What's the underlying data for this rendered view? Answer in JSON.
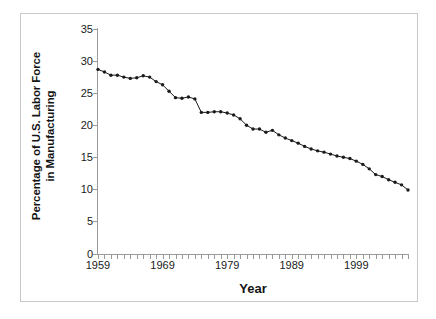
{
  "chart_data": {
    "type": "line",
    "title": "",
    "xlabel": "Year",
    "ylabel": "Percentage of U.S. Labor Force in Manufacturing",
    "ylabel_line1": "Percentage of U.S. Labor Force",
    "ylabel_line2": "in Manufacturing",
    "xlim": [
      1959,
      2007
    ],
    "ylim": [
      0,
      35
    ],
    "ytick_labels": [
      "0",
      "5",
      "10",
      "15",
      "20",
      "25",
      "30",
      "35"
    ],
    "ytick_values": [
      0,
      5,
      10,
      15,
      20,
      25,
      30,
      35
    ],
    "xtick_labels": [
      "1959",
      "1969",
      "1979",
      "1989",
      "1999"
    ],
    "xtick_values": [
      1959,
      1969,
      1979,
      1989,
      1999
    ],
    "x_minor_tick_step": 1,
    "grid": false,
    "legend": false,
    "marker": "circle",
    "line_color": "#1b1b1b",
    "x": [
      1959,
      1960,
      1961,
      1962,
      1963,
      1964,
      1965,
      1966,
      1967,
      1968,
      1969,
      1970,
      1971,
      1972,
      1973,
      1974,
      1975,
      1976,
      1977,
      1978,
      1979,
      1980,
      1981,
      1982,
      1983,
      1984,
      1985,
      1986,
      1987,
      1988,
      1989,
      1990,
      1991,
      1992,
      1993,
      1994,
      1995,
      1996,
      1997,
      1998,
      1999,
      2000,
      2001,
      2002,
      2003,
      2004,
      2005,
      2006,
      2007
    ],
    "values": [
      28.7,
      28.3,
      27.8,
      27.8,
      27.5,
      27.3,
      27.4,
      27.7,
      27.5,
      26.8,
      26.3,
      25.3,
      24.3,
      24.2,
      24.4,
      24.1,
      22.0,
      22.0,
      22.1,
      22.1,
      21.9,
      21.6,
      21.0,
      20.0,
      19.4,
      19.4,
      18.9,
      19.2,
      18.5,
      18.0,
      17.6,
      17.2,
      16.7,
      16.3,
      16.0,
      15.8,
      15.5,
      15.2,
      15.0,
      14.8,
      14.4,
      13.9,
      13.2,
      12.3,
      12.0,
      11.5,
      11.1,
      10.7,
      9.9
    ]
  }
}
